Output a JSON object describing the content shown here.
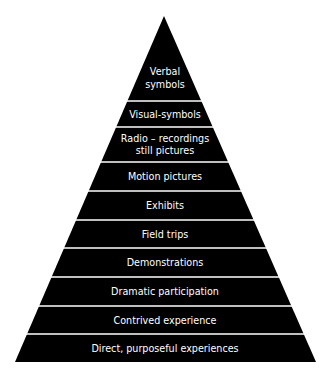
{
  "diagram": {
    "type": "pyramid",
    "title": "",
    "colors": {
      "fill": "#000000",
      "separator": "#ffffff",
      "text": "#ffffff",
      "background": "#ffffff"
    },
    "levels": [
      {
        "lines": [
          "Verbal",
          "symbols"
        ]
      },
      {
        "lines": [
          "Visual-symbols"
        ]
      },
      {
        "lines": [
          "Radio – recordings",
          "still pictures"
        ]
      },
      {
        "lines": [
          "Motion pictures"
        ]
      },
      {
        "lines": [
          "Exhibits"
        ]
      },
      {
        "lines": [
          "Field trips"
        ]
      },
      {
        "lines": [
          "Demonstrations"
        ]
      },
      {
        "lines": [
          "Dramatic participation"
        ]
      },
      {
        "lines": [
          "Contrived experience"
        ]
      },
      {
        "lines": [
          "Direct, purposeful experiences"
        ]
      }
    ]
  }
}
